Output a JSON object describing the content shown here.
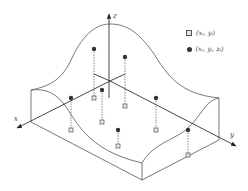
{
  "diagram": {
    "axes": {
      "x": {
        "label": "x"
      },
      "y": {
        "label": "y"
      },
      "z": {
        "label": "z"
      }
    },
    "legend": [
      {
        "symbol": "square",
        "label": "(xᵢ, yᵢ)"
      },
      {
        "symbol": "dot",
        "label": "(xᵢ, yᵢ, zᵢ)"
      }
    ],
    "colors": {
      "line": "#555555",
      "dot": "#333333",
      "square_fill": "#e6e6e6"
    },
    "points": [
      {
        "dot": [
          94,
          49
        ],
        "square": [
          94,
          98
        ]
      },
      {
        "dot": [
          125,
          57
        ],
        "square": [
          125,
          106
        ]
      },
      {
        "dot": [
          71,
          98
        ],
        "square": [
          71,
          130
        ]
      },
      {
        "dot": [
          102,
          90
        ],
        "square": [
          102,
          122
        ]
      },
      {
        "dot": [
          118,
          130
        ],
        "square": [
          118,
          146
        ]
      },
      {
        "dot": [
          156,
          98
        ],
        "square": [
          156,
          130
        ]
      },
      {
        "dot": [
          188,
          130
        ],
        "square": [
          188,
          155
        ]
      }
    ]
  }
}
